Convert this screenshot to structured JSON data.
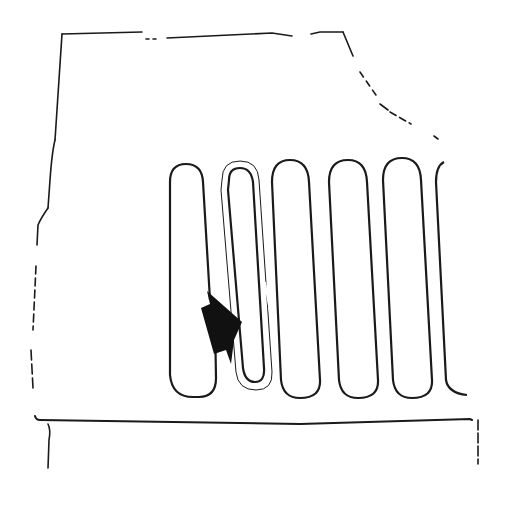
{
  "diagram": {
    "type": "line-drawing",
    "colors": {
      "background": "#ffffff",
      "ink": "#1a1a1a"
    },
    "elements": {
      "outline": "panel-outline",
      "serpentine": "serpentine-tube",
      "highlighted_loop": "double-walled-loop",
      "arrow": "flow-arrow",
      "base_line": "base-line"
    },
    "loops_count": 6
  }
}
